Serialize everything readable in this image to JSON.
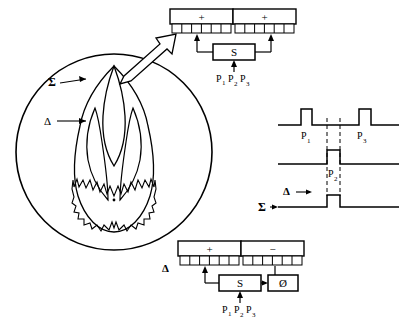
{
  "figure": {
    "kind": "monopulse-radar-antenna-diagram",
    "stroke_color": "#000000",
    "background_color": "#ffffff"
  },
  "antenna_pattern": {
    "label_sum": "Σ",
    "label_delta": "Δ",
    "circle": {
      "cx": 114,
      "cy": 152,
      "r": 98
    },
    "beam_center_x": 114
  },
  "callout": {
    "name": "block-arrow",
    "from": {
      "x": 128,
      "y": 76
    },
    "to": {
      "x": 180,
      "y": 24
    }
  },
  "top_network": {
    "left_port_label": "+",
    "right_port_label": "+",
    "combiner_label": "S",
    "pulse_labels": [
      "P",
      "P",
      "P"
    ],
    "pulse_subscripts": [
      "1",
      "2",
      "3"
    ],
    "element_count_per_side": 6
  },
  "bottom_network": {
    "left_port_label": "+",
    "right_port_label": "−",
    "combiner_label": "S",
    "phase_label": "Ø",
    "delta_label": "Δ",
    "pulse_labels": [
      "P",
      "P",
      "P"
    ],
    "pulse_subscripts": [
      "1",
      "2",
      "3"
    ],
    "element_count_per_side": 6
  },
  "waveforms": {
    "trace_top": {
      "name": "sum-channel-pulses",
      "pulse_labels": [
        "P",
        "P"
      ],
      "pulse_subscripts": [
        "1",
        "3"
      ],
      "baseline_y": 125,
      "pulse_height": 16,
      "pulses": [
        {
          "label": "P1",
          "x_start": 301,
          "x_end": 312
        },
        {
          "label": "P3",
          "x_start": 359,
          "x_end": 371
        }
      ]
    },
    "trace_middle": {
      "name": "p2-pulse",
      "pulse_label": "P",
      "pulse_subscript": "2",
      "baseline_y": 164,
      "pulse_height": 14,
      "pulses": [
        {
          "label": "P2",
          "x_start": 327,
          "x_end": 340
        }
      ]
    },
    "trace_bottom": {
      "name": "delta-sum-output",
      "label_delta": "Δ",
      "label_sum": "Σ",
      "baseline_y": 207,
      "pulse_height": 12,
      "delta_baseline_y": 192,
      "pulses": [
        {
          "x_start": 327,
          "x_end": 340
        }
      ]
    },
    "dashed_guides_x": [
      327,
      340
    ]
  }
}
